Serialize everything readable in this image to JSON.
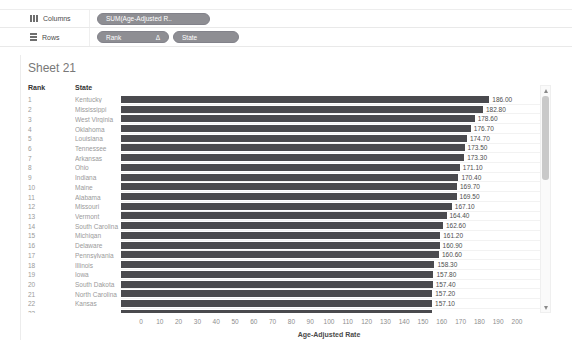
{
  "shelves": {
    "columns_label": "Columns",
    "rows_label": "Rows",
    "columns_pills": [
      {
        "label": "SUM(Age-Adjusted R..",
        "badge": ""
      }
    ],
    "rows_pills": [
      {
        "label": "Rank",
        "badge": "Δ"
      },
      {
        "label": "State",
        "badge": ""
      }
    ]
  },
  "sheet": {
    "title": "Sheet 21",
    "rank_header": "Rank",
    "state_header": "State"
  },
  "chart_data": {
    "type": "bar",
    "orientation": "horizontal",
    "title": "Sheet 21",
    "xlabel": "Age-Adjusted Rate",
    "ylabel": "Rank / State",
    "xlim": [
      0,
      200
    ],
    "xticks": [
      0,
      10,
      20,
      30,
      40,
      50,
      60,
      70,
      80,
      90,
      100,
      110,
      120,
      130,
      140,
      150,
      160,
      170,
      180,
      190,
      200
    ],
    "grid": false,
    "rows": [
      {
        "rank": "1",
        "state": "Kentucky",
        "value": 186.0,
        "label": "186.00"
      },
      {
        "rank": "2",
        "state": "Mississippi",
        "value": 182.8,
        "label": "182.80"
      },
      {
        "rank": "3",
        "state": "West Virginia",
        "value": 178.6,
        "label": "178.60"
      },
      {
        "rank": "4",
        "state": "Oklahoma",
        "value": 176.7,
        "label": "176.70"
      },
      {
        "rank": "5",
        "state": "Louisiana",
        "value": 174.7,
        "label": "174.70"
      },
      {
        "rank": "6",
        "state": "Tennessee",
        "value": 173.5,
        "label": "173.50"
      },
      {
        "rank": "7",
        "state": "Arkansas",
        "value": 173.3,
        "label": "173.30"
      },
      {
        "rank": "8",
        "state": "Ohio",
        "value": 171.1,
        "label": "171.10"
      },
      {
        "rank": "9",
        "state": "Indiana",
        "value": 170.4,
        "label": "170.40"
      },
      {
        "rank": "10",
        "state": "Maine",
        "value": 169.7,
        "label": "169.70"
      },
      {
        "rank": "11",
        "state": "Alabama",
        "value": 169.5,
        "label": "169.50"
      },
      {
        "rank": "12",
        "state": "Missouri",
        "value": 167.1,
        "label": "167.10"
      },
      {
        "rank": "13",
        "state": "Vermont",
        "value": 164.4,
        "label": "164.40"
      },
      {
        "rank": "14",
        "state": "South Carolina",
        "value": 162.6,
        "label": "162.60"
      },
      {
        "rank": "15",
        "state": "Michigan",
        "value": 161.2,
        "label": "161.20"
      },
      {
        "rank": "16",
        "state": "Delaware",
        "value": 160.9,
        "label": "160.90"
      },
      {
        "rank": "17",
        "state": "Pennsylvania",
        "value": 160.6,
        "label": "160.60"
      },
      {
        "rank": "18",
        "state": "Illinois",
        "value": 158.3,
        "label": "158.30"
      },
      {
        "rank": "19",
        "state": "Iowa",
        "value": 157.8,
        "label": "157.80"
      },
      {
        "rank": "20",
        "state": "South Dakota",
        "value": 157.4,
        "label": "157.40"
      },
      {
        "rank": "21",
        "state": "North Carolina",
        "value": 157.2,
        "label": "157.20"
      },
      {
        "rank": "22",
        "state": "Kansas",
        "value": 157.1,
        "label": "157.10"
      }
    ],
    "partial_row": {
      "rank": "23",
      "state": "",
      "value": 157.0,
      "label": ""
    }
  },
  "colors": {
    "bar": "#4a4a4e",
    "pill_bg": "#8e8e93",
    "pill_text": "#ffffff",
    "title_text": "#787878",
    "header_text": "#333333",
    "row_text": "#9a9a9a",
    "value_text": "#4d4d4d",
    "tick_text": "#8e8e8e"
  }
}
